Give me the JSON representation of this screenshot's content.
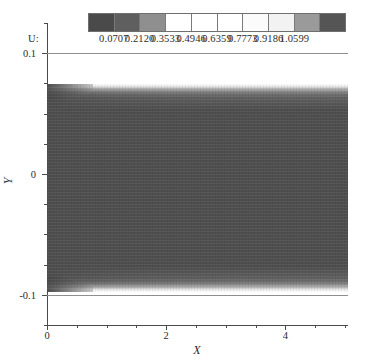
{
  "figure": {
    "kind": "cfd-contour-plot",
    "background": "#ffffff"
  },
  "colorbar": {
    "variable_label": "U:",
    "tick_values": [
      "0.0707",
      "0.2120",
      "0.3533",
      "0.4946",
      "0.6359",
      "0.7773",
      "0.9186",
      "1.0599"
    ],
    "cell_colors": [
      "#4a4a4a",
      "#5f5f5f",
      "#8f8f8f",
      "#ffffff",
      "#ffffff",
      "#ffffff",
      "#fbfbfb",
      "#f2f2f2",
      "#9a9a9a",
      "#555555"
    ],
    "orientation": "horizontal",
    "segments": 10
  },
  "axes": {
    "x": {
      "label": "X",
      "ticks": [
        "0",
        "2",
        "4"
      ],
      "tick_positions": [
        0,
        2,
        4
      ],
      "min": 0,
      "max": 5.05,
      "minor_count": 3
    },
    "y": {
      "label": "Y",
      "ticks": [
        "0.1",
        "0",
        "-0.1"
      ],
      "tick_positions": [
        0.1,
        0,
        -0.1
      ],
      "min": -0.125,
      "max": 0.125,
      "minor_count": 3
    }
  },
  "chart_data": {
    "type": "heatmap",
    "title": "",
    "xlabel": "X",
    "ylabel": "Y",
    "xlim": [
      0,
      5.05
    ],
    "ylim": [
      -0.125,
      0.125
    ],
    "grid": false,
    "legend": "top-colorbar",
    "colormap": "grayscale-banded",
    "value_label": "U",
    "vmin": 0.0707,
    "vmax": 1.0599,
    "levels": [
      0.0707,
      0.212,
      0.3533,
      0.4946,
      0.6359,
      0.7773,
      0.9186,
      1.0599
    ],
    "field_summary": {
      "core_value": 0.42,
      "wall_value": 0.07,
      "freestream_value": 1.06,
      "wall_positions": [
        0.1,
        -0.1
      ],
      "boundary_layer_thickness_at_x": [
        {
          "x": 0.0,
          "delta": 0.002
        },
        {
          "x": 1.0,
          "delta": 0.008
        },
        {
          "x": 2.0,
          "delta": 0.011
        },
        {
          "x": 3.0,
          "delta": 0.013
        },
        {
          "x": 4.0,
          "delta": 0.015
        },
        {
          "x": 5.0,
          "delta": 0.017
        }
      ]
    }
  }
}
